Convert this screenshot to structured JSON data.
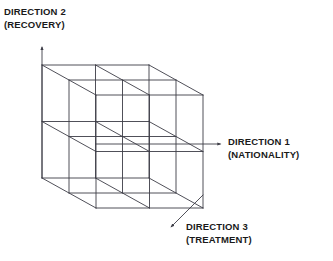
{
  "figure": {
    "type": "3d-cube-grid-diagram",
    "title": "",
    "background_color": "#ffffff",
    "line_color": "#3c3c46",
    "text_color": "#1a1a1a",
    "grid_divisions": 2,
    "subcube_count": 8,
    "projection": "oblique-cavalier",
    "axes": [
      {
        "id": "direction-1",
        "name": "DIRECTION 1",
        "qualifier": "(NATIONALITY)",
        "orientation": "horizontal-right",
        "arrow_from": [
          96,
          144
        ],
        "arrow_to": [
          222,
          144
        ]
      },
      {
        "id": "direction-2",
        "name": "DIRECTION 2",
        "qualifier": "(RECOVERY)",
        "orientation": "vertical-up",
        "arrow_from": [
          42,
          178
        ],
        "arrow_to": [
          42,
          46
        ]
      },
      {
        "id": "direction-3",
        "name": "DIRECTION 3",
        "qualifier": "(TREATMENT)",
        "orientation": "diagonal-down-left",
        "arrow_from": [
          203,
          195
        ],
        "arrow_to": [
          170,
          228
        ]
      }
    ],
    "cube": {
      "origin_back_top_left": [
        42,
        65
      ],
      "width": 107,
      "height": 113,
      "depth_offset": [
        54,
        30
      ]
    }
  },
  "labels": {
    "direction1": {
      "line1": "DIRECTION 1",
      "line2": "(NATIONALITY)"
    },
    "direction2": {
      "line1": "DIRECTION 2",
      "line2": "(RECOVERY)"
    },
    "direction3": {
      "line1": "DIRECTION 3",
      "line2": "(TREATMENT)"
    }
  }
}
